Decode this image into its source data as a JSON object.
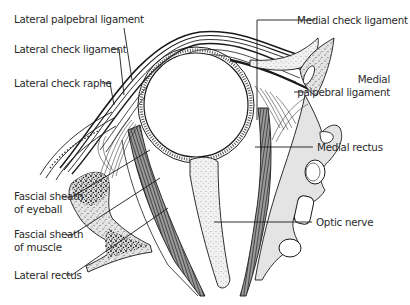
{
  "figure": {
    "type": "anatomical-diagram",
    "colors": {
      "line": "#1a1a1a",
      "bone_fill": "#e2e2e2",
      "bone_speckle": "#222222",
      "muscle_fill": "#8a8a8a",
      "background": "#ffffff"
    }
  },
  "labels": {
    "left": [
      {
        "id": "lateral-palpebral-ligament",
        "text": "Lateral palpebral ligament"
      },
      {
        "id": "lateral-check-ligament",
        "text": "Lateral check ligament"
      },
      {
        "id": "lateral-check-raphe",
        "text": "Lateral check raphe"
      },
      {
        "id": "fascial-sheath-eyeball",
        "line1": "Fascial sheath",
        "line2": "of eyeball"
      },
      {
        "id": "fascial-sheath-muscle",
        "line1": "Fascial sheath",
        "line2": "of muscle"
      },
      {
        "id": "lateral-rectus",
        "text": "Lateral rectus"
      }
    ],
    "right": [
      {
        "id": "medial-check-ligament",
        "text": "Medial check ligament"
      },
      {
        "id": "medial-palpebral-ligament",
        "line1": "Medial",
        "line2": "palpebral ligament"
      },
      {
        "id": "medial-rectus",
        "text": "Medial rectus"
      },
      {
        "id": "optic-nerve",
        "text": "Optic nerve"
      }
    ]
  }
}
